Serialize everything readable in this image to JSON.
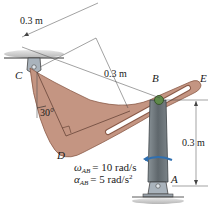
{
  "figure": {
    "points": {
      "A": "A",
      "B": "B",
      "C": "C",
      "D": "D",
      "E": "E"
    },
    "dimensions": {
      "top_length": "0.3 m",
      "mid_length": "0.3 m",
      "vertical_length": "0.3 m",
      "angle": "30°"
    },
    "given": {
      "omega": "ω",
      "omega_sub": "AB",
      "omega_value": "= 10 rad/s",
      "alpha": "α",
      "alpha_sub": "AB",
      "alpha_value": "= 5 rad/s",
      "alpha_exp": "2"
    },
    "colors": {
      "plate": "#c49582",
      "plate_edge": "#8a5a48",
      "rod": "#6b7378",
      "pin": "#5f8a4a",
      "support": "#9aa3ab",
      "rotation_arrow": "#2f6fb0",
      "ground": "#c8c8c8"
    }
  }
}
